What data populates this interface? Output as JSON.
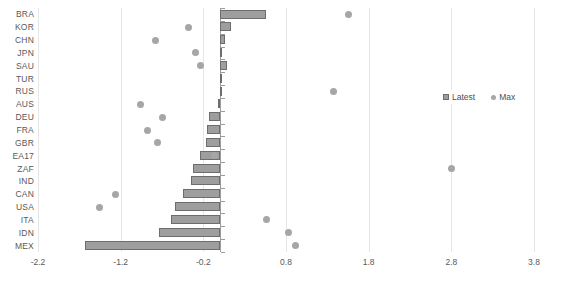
{
  "chart_data": {
    "type": "bar",
    "title": "",
    "subtitle": "",
    "xlabel": "",
    "ylabel": "",
    "orientation": "horizontal",
    "grid": true,
    "xlim": [
      -2.2,
      3.8
    ],
    "xticks": [
      -2.2,
      -1.2,
      -0.2,
      0.8,
      1.8,
      2.8,
      3.8
    ],
    "xticklabels": [
      "-2.2",
      "-1.2",
      "-0.2",
      "0.8",
      "1.8",
      "2.8",
      "3.8"
    ],
    "categories": [
      "BRA",
      "KOR",
      "CHN",
      "JPN",
      "SAU",
      "TUR",
      "RUS",
      "AUS",
      "DEU",
      "FRA",
      "GBR",
      "EA17",
      "ZAF",
      "IND",
      "CAN",
      "USA",
      "ITA",
      "IDN",
      "MEX"
    ],
    "legend_position": "right-middle",
    "series": [
      {
        "name": "Latest",
        "marker": "bar",
        "color": "#9e9e9e",
        "values": [
          0.56,
          0.14,
          0.06,
          0.02,
          0.09,
          0.01,
          0.0,
          -0.02,
          -0.13,
          -0.16,
          -0.17,
          -0.24,
          -0.33,
          -0.35,
          -0.45,
          -0.54,
          -0.59,
          -0.74,
          -1.63
        ]
      },
      {
        "name": "Max",
        "marker": "dot",
        "color": "#a6a6a6",
        "values": [
          1.55,
          -0.38,
          -0.78,
          -0.29,
          -0.23,
          null,
          1.37,
          -0.96,
          -0.69,
          -0.87,
          -0.76,
          -0.07,
          2.8,
          null,
          -1.26,
          -1.46,
          0.57,
          0.83,
          0.91
        ]
      }
    ]
  },
  "legend": {
    "entries": [
      {
        "label": "Latest",
        "marker": "square"
      },
      {
        "label": "Max",
        "marker": "dot"
      }
    ]
  }
}
